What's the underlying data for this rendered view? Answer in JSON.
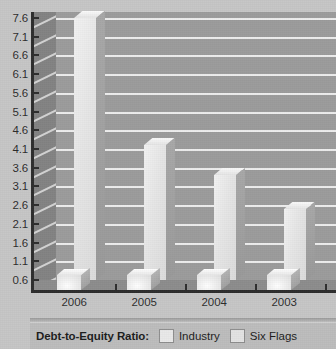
{
  "chart_data": {
    "type": "bar",
    "title": "Debt-to-Equity Ratio:",
    "xlabel": "",
    "ylabel": "",
    "categories": [
      "2006",
      "2005",
      "2004",
      "2003"
    ],
    "series": [
      {
        "name": "Industry",
        "values": [
          1.0,
          1.0,
          1.0,
          1.0
        ]
      },
      {
        "name": "Six Flags",
        "values": [
          7.6,
          4.2,
          3.4,
          2.5
        ]
      }
    ],
    "ylim": [
      0.6,
      7.6
    ],
    "ytick_labels": [
      "0.6",
      "1.1",
      "1.6",
      "2.1",
      "2.6",
      "3.1",
      "3.6",
      "4.1",
      "4.6",
      "5.1",
      "5.6",
      "6.1",
      "6.6",
      "7.1",
      "7.6"
    ],
    "ytick_values": [
      0.6,
      1.1,
      1.6,
      2.1,
      2.6,
      3.1,
      3.6,
      4.1,
      4.6,
      5.1,
      5.6,
      6.1,
      6.6,
      7.1,
      7.6
    ],
    "grid": true,
    "grid_axis": "y",
    "legend_position": "bottom",
    "style": "3d-grouped-bars"
  },
  "legend": {
    "title": "Debt-to-Equity Ratio:",
    "entries": [
      {
        "label": "Industry",
        "color": "#e9e9e9"
      },
      {
        "label": "Six Flags",
        "color": "#e3e3e3"
      }
    ]
  },
  "colors": {
    "page_background": "#c6c6c6",
    "plot_background": "#9c9c9c",
    "side_wall": "#838383",
    "gridline": "#ededed",
    "axis": "#2e2e2e",
    "bar_face": "#e6e6e6",
    "bar_side": "#a0a0a0",
    "legend_background": "#bdbdbd",
    "text": "#2b2b2b"
  }
}
